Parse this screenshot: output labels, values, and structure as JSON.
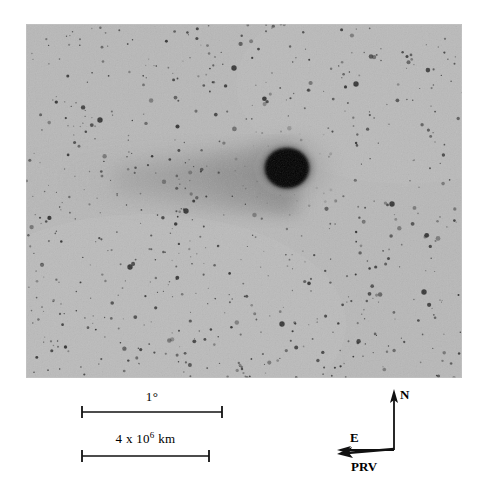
{
  "figure": {
    "kind": "astronomical-photographic-plate",
    "plate": {
      "background_color": "#b8b8b8",
      "ink_color": "#1a1a1a",
      "coma": {
        "center_x_pct": 59.9,
        "center_y_pct": 40.7,
        "core_radius_px": 23,
        "halo_radius_px": 52
      },
      "tail": {
        "direction": "left",
        "length_pct": 60,
        "from_x_pct": 58,
        "to_x_pct": 0,
        "center_y_pct": 44
      },
      "star_count": 700
    }
  },
  "scalebars": [
    {
      "id": "angular",
      "label_main": "1",
      "label_sup": "",
      "label_degree": "°",
      "label_unit": "",
      "length_px": 144,
      "value": "1°"
    },
    {
      "id": "linear",
      "label_main": "4 x 10",
      "label_sup": "6",
      "label_degree": "",
      "label_unit": " km",
      "length_px": 130,
      "value": "4 x 10^6 km"
    }
  ],
  "compass": {
    "north_label": "N",
    "east_label": "E",
    "prv_label": "PRV",
    "north_direction": "up",
    "east_direction": "left",
    "prv_direction": "left-slightly-down"
  },
  "page_bleed": {
    "text": "partial line of page text cropped at the bottom edge"
  }
}
